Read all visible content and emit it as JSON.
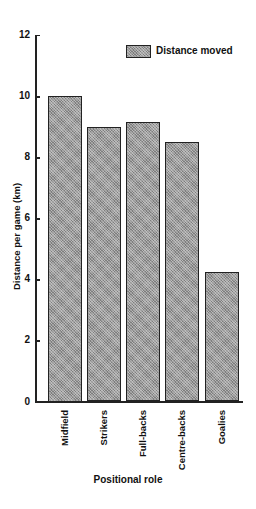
{
  "chart_data": {
    "type": "bar",
    "title": "",
    "xlabel": "Positional role",
    "ylabel": "Distance per game (km)",
    "categories": [
      "Midfield",
      "Strikers",
      "Full-backs",
      "Centre-backs",
      "Goalies"
    ],
    "series": [
      {
        "name": "Distance moved",
        "values": [
          10.0,
          9.0,
          9.15,
          8.5,
          4.25
        ]
      }
    ],
    "ylim": [
      0,
      12
    ],
    "yticks": [
      0,
      2,
      4,
      6,
      8,
      10,
      12
    ],
    "grid": false,
    "legend_position": "upper right",
    "colors": {
      "bar_fill": "#9a9a9a",
      "bar_edge": "#222222"
    }
  },
  "labels": {
    "yticks": [
      "0",
      "2",
      "4",
      "6",
      "8",
      "10",
      "12"
    ],
    "legend": "Distance moved"
  }
}
